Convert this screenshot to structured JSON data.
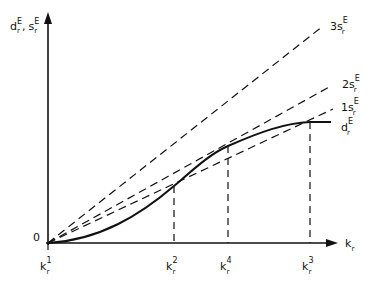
{
  "diagram": {
    "y_axis_label": {
      "main1": "d",
      "sup1": "E",
      "sub1": "r",
      "sep": ",",
      "main2": "s",
      "sup2": "E",
      "sub2": "r"
    },
    "x_axis_label": {
      "main": "k",
      "sub": "r"
    },
    "origin_label": "0",
    "lines": [
      {
        "prefix": "3",
        "main": "s",
        "sup": "E",
        "sub": "r"
      },
      {
        "prefix": "2",
        "main": "s",
        "sup": "E",
        "sub": "r"
      },
      {
        "prefix": "1",
        "main": "s",
        "sup": "E",
        "sub": "r"
      }
    ],
    "curve": {
      "main": "d",
      "sup": "E",
      "sub": "r"
    },
    "x_ticks": [
      {
        "main": "k",
        "sup": "1",
        "sub": "r"
      },
      {
        "main": "k",
        "sup": "2",
        "sub": "r"
      },
      {
        "main": "k",
        "sup": "4",
        "sub": "r"
      },
      {
        "main": "k",
        "sup": "3",
        "sub": "r"
      }
    ]
  }
}
